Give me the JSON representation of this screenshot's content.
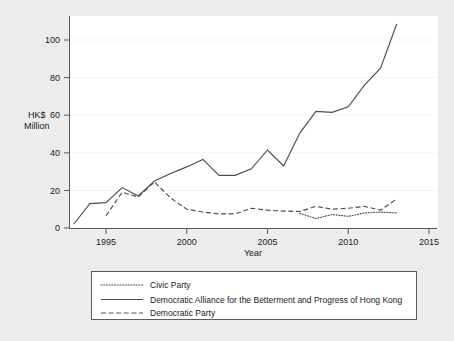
{
  "chart_data": {
    "type": "line",
    "title": "",
    "xlabel": "Year",
    "ylabel": "HK$ Million",
    "ylabel_line1": "HK$",
    "ylabel_line2": "Million",
    "xlim": [
      1993,
      2015
    ],
    "ylim": [
      0,
      110
    ],
    "xticks": [
      1995,
      2000,
      2005,
      2010,
      2015
    ],
    "yticks": [
      0,
      20,
      40,
      60,
      80,
      100
    ],
    "grid": false,
    "legend_position": "bottom",
    "series": [
      {
        "name": "Civic Party",
        "style": "dotted",
        "x": [
          2007,
          2008,
          2009,
          2010,
          2011,
          2012,
          2013
        ],
        "values": [
          7.8,
          5.0,
          7.2,
          6.2,
          8.0,
          8.5,
          8.0
        ]
      },
      {
        "name": "Democratic Alliance for the Betterment and Progress of Hong Kong",
        "style": "solid",
        "x": [
          1993,
          1994,
          1995,
          1996,
          1997,
          1998,
          1999,
          2000,
          2001,
          2002,
          2003,
          2004,
          2005,
          2006,
          2007,
          2008,
          2009,
          2010,
          2011,
          2012,
          2013
        ],
        "values": [
          2.0,
          13.0,
          13.5,
          21.5,
          17.0,
          25.0,
          29.0,
          32.5,
          36.5,
          28.0,
          28.0,
          31.5,
          41.5,
          33.0,
          50.5,
          62.0,
          61.5,
          64.5,
          76.0,
          85.0,
          108.5
        ]
      },
      {
        "name": "Democratic Party",
        "style": "dashed",
        "x": [
          1995,
          1996,
          1997,
          1998,
          1999,
          2000,
          2001,
          2002,
          2003,
          2004,
          2005,
          2006,
          2007,
          2008,
          2009,
          2010,
          2011,
          2012,
          2013
        ],
        "values": [
          6.5,
          19.0,
          16.5,
          24.5,
          16.0,
          10.0,
          8.5,
          7.5,
          7.5,
          10.5,
          9.5,
          9.0,
          8.8,
          11.5,
          10.0,
          10.5,
          11.5,
          9.5,
          15.5
        ]
      }
    ]
  },
  "legend": {
    "items": [
      {
        "label": "Civic Party",
        "style": "dotted"
      },
      {
        "label": "Democratic Alliance for the Betterment and Progress of Hong Kong",
        "style": "solid"
      },
      {
        "label": "Democratic Party",
        "style": "dashed"
      }
    ]
  },
  "axis": {
    "x_title": "Year",
    "y_title_line1": "HK$",
    "y_title_line2": "Million",
    "xtick_labels": [
      "1995",
      "2000",
      "2005",
      "2010",
      "2015"
    ],
    "ytick_labels": [
      "0",
      "20",
      "40",
      "60",
      "80",
      "100"
    ]
  },
  "colors": {
    "background": "#ececec",
    "plot_area": "#ffffff",
    "line": "#4d4d4d",
    "axis": "#5a5a5a",
    "text": "#1a1a1a"
  }
}
